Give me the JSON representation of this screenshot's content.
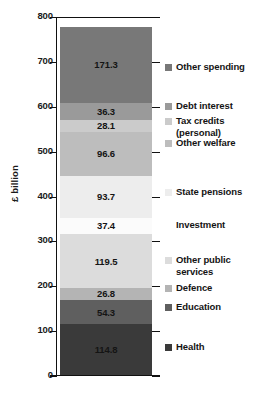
{
  "chart_data": {
    "type": "bar",
    "subtype": "stacked-bar-single-column",
    "title": "",
    "xlabel": "",
    "ylabel": "£ billion",
    "ylim": [
      0,
      800
    ],
    "yticks": [
      0,
      100,
      200,
      300,
      400,
      500,
      600,
      700,
      800
    ],
    "ytick_labels": [
      "0",
      "100",
      "200",
      "300",
      "400",
      "500",
      "600",
      "700",
      "800"
    ],
    "grid": false,
    "legend_position": "right",
    "categories": [
      "Total managed expenditure"
    ],
    "total": 779.8,
    "units": "£ billion",
    "stack_order": "bottom-to-top",
    "series": [
      {
        "name": "Health",
        "value": 114.8,
        "label": "114.8",
        "color": "#3a3a3a",
        "legend_swatch": true
      },
      {
        "name": "Education",
        "value": 54.3,
        "label": "54.3",
        "color": "#5f5f5f",
        "legend_swatch": true
      },
      {
        "name": "Defence",
        "value": 26.8,
        "label": "26.8",
        "color": "#b4b4b4",
        "legend_swatch": true
      },
      {
        "name": "Other public services",
        "value": 119.5,
        "label": "119.5",
        "color": "#dcdcdc",
        "legend_swatch": true
      },
      {
        "name": "Investment",
        "value": 37.4,
        "label": "37.4",
        "color": "#fbfbfb",
        "legend_swatch": false
      },
      {
        "name": "State pensions",
        "value": 93.7,
        "label": "93.7",
        "color": "#ededed",
        "legend_swatch": true
      },
      {
        "name": "Other welfare",
        "value": 96.6,
        "label": "96.6",
        "color": "#bdbdbd",
        "legend_swatch": true
      },
      {
        "name": "Tax credits (personal)",
        "value": 28.1,
        "label": "28.1",
        "color": "#cbcbcb",
        "legend_swatch": true
      },
      {
        "name": "Debt interest",
        "value": 36.3,
        "label": "36.3",
        "color": "#9a9a9a",
        "legend_swatch": true
      },
      {
        "name": "Other spending",
        "value": 171.3,
        "label": "171.3",
        "color": "#787878",
        "legend_swatch": true
      }
    ],
    "legend_entries": [
      {
        "name": "Other spending",
        "label": "Other spending",
        "color": "#787878",
        "swatch": true
      },
      {
        "name": "Debt interest",
        "label": "Debt interest",
        "color": "#9a9a9a",
        "swatch": true
      },
      {
        "name": "Tax credits (personal)",
        "label": "Tax credits",
        "label2": "(personal)",
        "color": "#cbcbcb",
        "swatch": true
      },
      {
        "name": "Other welfare",
        "label": "Other welfare",
        "color": "#bdbdbd",
        "swatch": true
      },
      {
        "name": "State pensions",
        "label": "State pensions",
        "color": "#ededed",
        "swatch": true
      },
      {
        "name": "Investment",
        "label": "Investment",
        "color": "#fbfbfb",
        "swatch": false
      },
      {
        "name": "Other public services",
        "label": "Other public",
        "label2": "services",
        "color": "#dcdcdc",
        "swatch": true
      },
      {
        "name": "Defence",
        "label": "Defence",
        "color": "#b4b4b4",
        "swatch": true
      },
      {
        "name": "Education",
        "label": "Education",
        "color": "#5f5f5f",
        "swatch": true
      },
      {
        "name": "Health",
        "label": "Health",
        "color": "#3a3a3a",
        "swatch": true
      }
    ]
  }
}
